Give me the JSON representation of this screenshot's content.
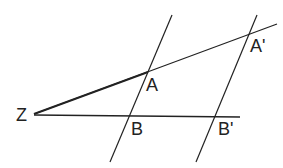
{
  "diagram": {
    "labels": {
      "Z": "Z",
      "A": "A",
      "A_prime": "A'",
      "B": "B",
      "B_prime": "B'"
    },
    "stroke_color": "#222222"
  }
}
